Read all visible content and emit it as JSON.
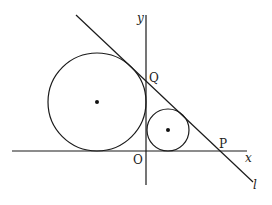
{
  "diagram": {
    "type": "geometry",
    "axes": {
      "x_label": "x",
      "y_label": "y",
      "origin_label": "O"
    },
    "line": {
      "label": "l"
    },
    "points": {
      "P": "P",
      "Q": "Q"
    },
    "circles": [
      {
        "name": "large circle",
        "tangent_to": [
          "x-axis",
          "y-axis",
          "l"
        ],
        "center_marked": true
      },
      {
        "name": "small circle",
        "tangent_to": [
          "x-axis",
          "y-axis",
          "l"
        ],
        "center_marked": true
      }
    ],
    "colors": {
      "stroke": "#1a1a1a",
      "background": "#ffffff"
    }
  }
}
